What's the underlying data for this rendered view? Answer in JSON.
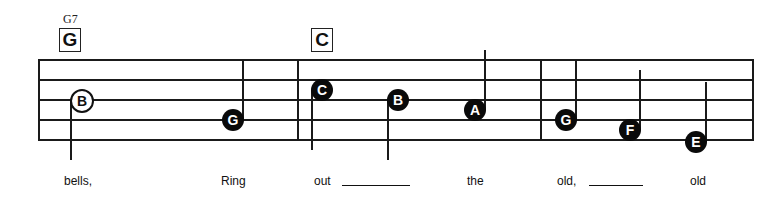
{
  "chords": [
    {
      "name": "G",
      "alt": "G7",
      "x": 59
    },
    {
      "name": "C",
      "alt": null,
      "x": 311
    }
  ],
  "staff": {
    "left": 39,
    "right": 753,
    "lines_y": [
      60,
      80,
      100,
      120,
      140
    ]
  },
  "barlines_x": [
    298,
    541
  ],
  "notes": [
    {
      "letter": "B",
      "type": "half",
      "x": 81,
      "y": 100,
      "stem": "down",
      "stem_len": 60
    },
    {
      "letter": "G",
      "type": "quarter",
      "x": 233,
      "y": 120,
      "stem": "up",
      "stem_len": 60
    },
    {
      "letter": "C",
      "type": "quarter",
      "x": 322,
      "y": 90,
      "stem": "down",
      "stem_len": 60
    },
    {
      "letter": "B",
      "type": "quarter",
      "x": 398,
      "y": 100,
      "stem": "down",
      "stem_len": 60
    },
    {
      "letter": "A",
      "type": "quarter",
      "x": 475,
      "y": 110,
      "stem": "up",
      "stem_len": 60
    },
    {
      "letter": "G",
      "type": "quarter",
      "x": 566,
      "y": 120,
      "stem": "up",
      "stem_len": 60
    },
    {
      "letter": "F",
      "type": "quarter",
      "x": 630,
      "y": 130,
      "stem": "up",
      "stem_len": 60
    },
    {
      "letter": "E",
      "type": "quarter",
      "x": 696,
      "y": 142,
      "stem": "up",
      "stem_len": 60
    }
  ],
  "lyrics": [
    {
      "text": "bells,",
      "x": 64
    },
    {
      "text": "Ring",
      "x": 221
    },
    {
      "text": "out",
      "x": 314
    },
    {
      "text": "the",
      "x": 467
    },
    {
      "text": "old,",
      "x": 557
    },
    {
      "text": "old",
      "x": 690
    }
  ],
  "blanks": [
    {
      "x": 342,
      "width": 68
    },
    {
      "x": 589,
      "width": 54
    }
  ]
}
